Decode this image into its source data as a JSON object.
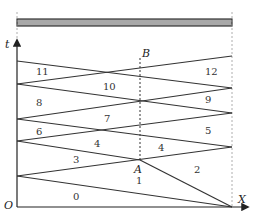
{
  "diagram": {
    "type": "wave-reflection x-t diagram",
    "colors": {
      "line": "#333333",
      "bar_fill": "#a8a8a8",
      "bar_stroke": "#333333",
      "dashed": "#888888"
    },
    "axes": {
      "t_label": "t",
      "x_label": "X",
      "origin_label": "O"
    },
    "points": {
      "A": "A",
      "B": "B"
    },
    "regions": [
      {
        "id": "0",
        "label": "0"
      },
      {
        "id": "1",
        "label": "1"
      },
      {
        "id": "2",
        "label": "2"
      },
      {
        "id": "3",
        "label": "3"
      },
      {
        "id": "4a",
        "label": "4"
      },
      {
        "id": "4b",
        "label": "4"
      },
      {
        "id": "5",
        "label": "5"
      },
      {
        "id": "6",
        "label": "6"
      },
      {
        "id": "7",
        "label": "7"
      },
      {
        "id": "8",
        "label": "8"
      },
      {
        "id": "9",
        "label": "9"
      },
      {
        "id": "10",
        "label": "10"
      },
      {
        "id": "11",
        "label": "11"
      },
      {
        "id": "12",
        "label": "12"
      }
    ]
  }
}
